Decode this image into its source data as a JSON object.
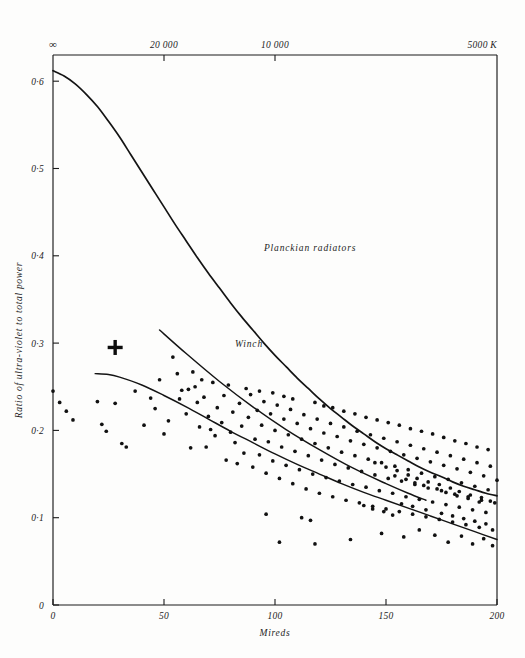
{
  "chart_data": {
    "type": "scatter",
    "title": "",
    "subtitle": "",
    "xlabel": "Mireds",
    "ylabel": "Ratio of ultra-violet to total power",
    "xlim": [
      0,
      200
    ],
    "ylim": [
      0,
      0.63
    ],
    "grid": false,
    "legend_position": "inline-annotations",
    "x_ticks": [
      0,
      50,
      100,
      150,
      200
    ],
    "x_tick_labels": [
      "0",
      "50",
      "100",
      "150",
      "200"
    ],
    "y_ticks": [
      0,
      0.1,
      0.2,
      0.3,
      0.4,
      0.5,
      0.6
    ],
    "y_tick_labels": [
      "0",
      "0·1",
      "0·2",
      "0·3",
      "0·4",
      "0·5",
      "0·6"
    ],
    "secondary_axis": {
      "position": "top",
      "label": "",
      "unit": "K",
      "ticks_mireds": [
        0,
        50,
        100,
        200
      ],
      "tick_labels": [
        "∞",
        "20 000",
        "10 000",
        "5000 K"
      ]
    },
    "annotations": [
      {
        "text": "Planckian radiators",
        "x": 95,
        "y": 0.405
      },
      {
        "text": "Winch",
        "x": 82,
        "y": 0.295
      }
    ],
    "series": [
      {
        "name": "Planckian radiators",
        "type": "line",
        "points": [
          [
            0,
            0.612
          ],
          [
            5,
            0.606
          ],
          [
            10,
            0.597
          ],
          [
            15,
            0.585
          ],
          [
            20,
            0.571
          ],
          [
            25,
            0.554
          ],
          [
            30,
            0.536
          ],
          [
            35,
            0.516
          ],
          [
            40,
            0.496
          ],
          [
            45,
            0.476
          ],
          [
            50,
            0.456
          ],
          [
            55,
            0.436
          ],
          [
            60,
            0.417
          ],
          [
            65,
            0.398
          ],
          [
            70,
            0.38
          ],
          [
            75,
            0.363
          ],
          [
            80,
            0.346
          ],
          [
            85,
            0.33
          ],
          [
            90,
            0.315
          ],
          [
            95,
            0.3
          ],
          [
            100,
            0.286
          ],
          [
            105,
            0.273
          ],
          [
            110,
            0.26
          ],
          [
            115,
            0.248
          ],
          [
            120,
            0.236
          ],
          [
            125,
            0.225
          ],
          [
            130,
            0.215
          ],
          [
            135,
            0.205
          ],
          [
            140,
            0.196
          ],
          [
            145,
            0.187
          ],
          [
            150,
            0.179
          ],
          [
            155,
            0.172
          ],
          [
            160,
            0.165
          ],
          [
            165,
            0.158
          ],
          [
            170,
            0.152
          ],
          [
            175,
            0.147
          ],
          [
            180,
            0.141
          ],
          [
            185,
            0.136
          ],
          [
            190,
            0.132
          ],
          [
            195,
            0.128
          ],
          [
            200,
            0.125
          ]
        ]
      },
      {
        "name": "Winch",
        "type": "line",
        "points": [
          [
            48,
            0.315
          ],
          [
            60,
            0.288
          ],
          [
            75,
            0.256
          ],
          [
            90,
            0.227
          ],
          [
            105,
            0.201
          ],
          [
            120,
            0.178
          ],
          [
            135,
            0.157
          ],
          [
            150,
            0.139
          ],
          [
            160,
            0.128
          ],
          [
            168,
            0.12
          ]
        ]
      },
      {
        "name": "Mean observed curve",
        "type": "line",
        "points": [
          [
            19,
            0.265
          ],
          [
            25,
            0.264
          ],
          [
            30,
            0.261
          ],
          [
            40,
            0.252
          ],
          [
            50,
            0.24
          ],
          [
            60,
            0.227
          ],
          [
            70,
            0.213
          ],
          [
            80,
            0.199
          ],
          [
            90,
            0.186
          ],
          [
            100,
            0.173
          ],
          [
            110,
            0.161
          ],
          [
            120,
            0.15
          ],
          [
            130,
            0.139
          ],
          [
            140,
            0.129
          ],
          [
            150,
            0.12
          ],
          [
            160,
            0.111
          ],
          [
            170,
            0.102
          ],
          [
            180,
            0.093
          ],
          [
            190,
            0.084
          ],
          [
            200,
            0.075
          ]
        ]
      },
      {
        "name": "Measured daylight samples",
        "type": "scatter",
        "marker": "dot",
        "points": [
          [
            0,
            0.245
          ],
          [
            3,
            0.232
          ],
          [
            6,
            0.222
          ],
          [
            9,
            0.212
          ],
          [
            20,
            0.233
          ],
          [
            22,
            0.207
          ],
          [
            24,
            0.199
          ],
          [
            28,
            0.231
          ],
          [
            31,
            0.185
          ],
          [
            33,
            0.181
          ],
          [
            37,
            0.245
          ],
          [
            41,
            0.206
          ],
          [
            44,
            0.237
          ],
          [
            46,
            0.225
          ],
          [
            48,
            0.258
          ],
          [
            50,
            0.196
          ],
          [
            52,
            0.211
          ],
          [
            54,
            0.284
          ],
          [
            56,
            0.265
          ],
          [
            57,
            0.236
          ],
          [
            58,
            0.246
          ],
          [
            60,
            0.219
          ],
          [
            61,
            0.247
          ],
          [
            62,
            0.18
          ],
          [
            64,
            0.25
          ],
          [
            65,
            0.232
          ],
          [
            66,
            0.204
          ],
          [
            68,
            0.238
          ],
          [
            69,
            0.181
          ],
          [
            70,
            0.216
          ],
          [
            72,
            0.255
          ],
          [
            73,
            0.194
          ],
          [
            74,
            0.226
          ],
          [
            76,
            0.209
          ],
          [
            77,
            0.24
          ],
          [
            78,
            0.166
          ],
          [
            80,
            0.198
          ],
          [
            81,
            0.221
          ],
          [
            82,
            0.186
          ],
          [
            84,
            0.231
          ],
          [
            85,
            0.205
          ],
          [
            86,
            0.174
          ],
          [
            88,
            0.215
          ],
          [
            89,
            0.241
          ],
          [
            90,
            0.158
          ],
          [
            91,
            0.19
          ],
          [
            92,
            0.223
          ],
          [
            93,
            0.172
          ],
          [
            94,
            0.206
          ],
          [
            95,
            0.233
          ],
          [
            96,
            0.151
          ],
          [
            97,
            0.187
          ],
          [
            98,
            0.219
          ],
          [
            99,
            0.165
          ],
          [
            100,
            0.2
          ],
          [
            101,
            0.229
          ],
          [
            102,
            0.145
          ],
          [
            103,
            0.181
          ],
          [
            104,
            0.213
          ],
          [
            105,
            0.16
          ],
          [
            106,
            0.195
          ],
          [
            107,
            0.224
          ],
          [
            108,
            0.139
          ],
          [
            109,
            0.176
          ],
          [
            110,
            0.208
          ],
          [
            111,
            0.155
          ],
          [
            112,
            0.19
          ],
          [
            113,
            0.218
          ],
          [
            114,
            0.133
          ],
          [
            115,
            0.171
          ],
          [
            116,
            0.202
          ],
          [
            117,
            0.15
          ],
          [
            118,
            0.185
          ],
          [
            119,
            0.213
          ],
          [
            120,
            0.128
          ],
          [
            121,
            0.166
          ],
          [
            122,
            0.197
          ],
          [
            123,
            0.146
          ],
          [
            124,
            0.18
          ],
          [
            125,
            0.208
          ],
          [
            126,
            0.124
          ],
          [
            127,
            0.161
          ],
          [
            128,
            0.193
          ],
          [
            129,
            0.142
          ],
          [
            130,
            0.175
          ],
          [
            131,
            0.204
          ],
          [
            132,
            0.12
          ],
          [
            133,
            0.157
          ],
          [
            134,
            0.188
          ],
          [
            135,
            0.138
          ],
          [
            136,
            0.171
          ],
          [
            137,
            0.199
          ],
          [
            138,
            0.117
          ],
          [
            139,
            0.153
          ],
          [
            140,
            0.184
          ],
          [
            141,
            0.135
          ],
          [
            142,
            0.167
          ],
          [
            143,
            0.195
          ],
          [
            144,
            0.113
          ],
          [
            145,
            0.149
          ],
          [
            146,
            0.18
          ],
          [
            147,
            0.131
          ],
          [
            148,
            0.163
          ],
          [
            149,
            0.191
          ],
          [
            150,
            0.11
          ],
          [
            151,
            0.145
          ],
          [
            152,
            0.176
          ],
          [
            153,
            0.128
          ],
          [
            154,
            0.159
          ],
          [
            155,
            0.187
          ],
          [
            156,
            0.107
          ],
          [
            157,
            0.142
          ],
          [
            158,
            0.172
          ],
          [
            159,
            0.124
          ],
          [
            160,
            0.155
          ],
          [
            161,
            0.183
          ],
          [
            162,
            0.104
          ],
          [
            163,
            0.138
          ],
          [
            164,
            0.168
          ],
          [
            165,
            0.121
          ],
          [
            166,
            0.151
          ],
          [
            167,
            0.179
          ],
          [
            168,
            0.101
          ],
          [
            169,
            0.134
          ],
          [
            170,
            0.164
          ],
          [
            171,
            0.118
          ],
          [
            172,
            0.147
          ],
          [
            173,
            0.175
          ],
          [
            174,
            0.098
          ],
          [
            175,
            0.131
          ],
          [
            176,
            0.16
          ],
          [
            177,
            0.115
          ],
          [
            178,
            0.144
          ],
          [
            179,
            0.171
          ],
          [
            180,
            0.095
          ],
          [
            181,
            0.127
          ],
          [
            182,
            0.156
          ],
          [
            183,
            0.112
          ],
          [
            184,
            0.14
          ],
          [
            185,
            0.167
          ],
          [
            186,
            0.092
          ],
          [
            187,
            0.124
          ],
          [
            188,
            0.152
          ],
          [
            189,
            0.109
          ],
          [
            190,
            0.136
          ],
          [
            191,
            0.163
          ],
          [
            192,
            0.089
          ],
          [
            193,
            0.12
          ],
          [
            194,
            0.148
          ],
          [
            195,
            0.106
          ],
          [
            196,
            0.132
          ],
          [
            197,
            0.159
          ],
          [
            198,
            0.086
          ],
          [
            199,
            0.117
          ],
          [
            200,
            0.143
          ],
          [
            63,
            0.267
          ],
          [
            67,
            0.258
          ],
          [
            71,
            0.201
          ],
          [
            79,
            0.252
          ],
          [
            83,
            0.162
          ],
          [
            87,
            0.248
          ],
          [
            93,
            0.245
          ],
          [
            96,
            0.104
          ],
          [
            99,
            0.243
          ],
          [
            104,
            0.239
          ],
          [
            108,
            0.236
          ],
          [
            112,
            0.1
          ],
          [
            116,
            0.097
          ],
          [
            118,
            0.232
          ],
          [
            122,
            0.228
          ],
          [
            126,
            0.226
          ],
          [
            131,
            0.222
          ],
          [
            136,
            0.219
          ],
          [
            141,
            0.215
          ],
          [
            146,
            0.212
          ],
          [
            151,
            0.209
          ],
          [
            156,
            0.206
          ],
          [
            161,
            0.202
          ],
          [
            166,
            0.199
          ],
          [
            171,
            0.196
          ],
          [
            176,
            0.192
          ],
          [
            181,
            0.188
          ],
          [
            186,
            0.185
          ],
          [
            191,
            0.181
          ],
          [
            196,
            0.178
          ],
          [
            102,
            0.072
          ],
          [
            118,
            0.07
          ],
          [
            134,
            0.075
          ],
          [
            148,
            0.082
          ],
          [
            158,
            0.078
          ],
          [
            165,
            0.086
          ],
          [
            172,
            0.08
          ],
          [
            178,
            0.072
          ],
          [
            184,
            0.079
          ],
          [
            189,
            0.07
          ],
          [
            194,
            0.076
          ],
          [
            198,
            0.068
          ],
          [
            154,
            0.148
          ],
          [
            159,
            0.144
          ],
          [
            163,
            0.14
          ],
          [
            167,
            0.137
          ],
          [
            173,
            0.133
          ],
          [
            177,
            0.129
          ],
          [
            182,
            0.125
          ],
          [
            187,
            0.122
          ],
          [
            192,
            0.118
          ],
          [
            145,
            0.163
          ],
          [
            150,
            0.158
          ],
          [
            155,
            0.154
          ],
          [
            160,
            0.149
          ],
          [
            164,
            0.145
          ],
          [
            169,
            0.141
          ],
          [
            174,
            0.138
          ],
          [
            179,
            0.134
          ],
          [
            183,
            0.13
          ],
          [
            188,
            0.126
          ],
          [
            193,
            0.123
          ],
          [
            197,
            0.119
          ],
          [
            140,
            0.114
          ],
          [
            144,
            0.11
          ],
          [
            149,
            0.107
          ],
          [
            153,
            0.103
          ],
          [
            157,
            0.116
          ],
          [
            162,
            0.113
          ],
          [
            168,
            0.109
          ],
          [
            175,
            0.105
          ],
          [
            180,
            0.102
          ],
          [
            185,
            0.099
          ],
          [
            190,
            0.096
          ],
          [
            195,
            0.093
          ]
        ]
      },
      {
        "name": "Reference point",
        "type": "scatter",
        "marker": "plus",
        "points": [
          [
            28,
            0.295
          ]
        ]
      }
    ]
  },
  "axes": {
    "x_axis_title": "Mireds",
    "y_axis_title": "Ratio of ultra-violet to total power",
    "top_axis_unit": "5000 K"
  }
}
